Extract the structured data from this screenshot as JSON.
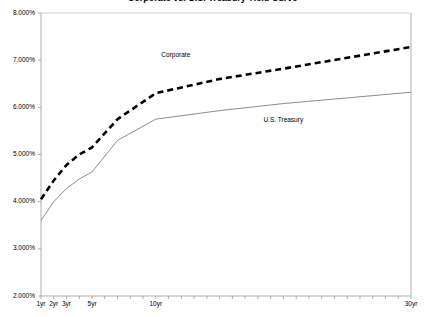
{
  "chart_data": {
    "type": "line",
    "title": "Corporate vs. U.S. Treasury Yield Curve",
    "xlabel": "",
    "ylabel": "",
    "xlim": [
      1,
      30
    ],
    "ylim": [
      2.0,
      8.0
    ],
    "grid": false,
    "legend_position": "inline-annotation",
    "y_tick_labels": [
      "8.000%",
      "7.000%",
      "6.000%",
      "5.000%",
      "4.000%",
      "3.000%",
      "2.000%"
    ],
    "y_tick_values": [
      8.0,
      7.0,
      6.0,
      5.0,
      4.0,
      3.0,
      2.0
    ],
    "x_tick_labels": [
      "1yr",
      "2yr",
      "3yr",
      "5yr",
      "10yr",
      "30yr"
    ],
    "x_tick_values": [
      1,
      2,
      3,
      5,
      10,
      30
    ],
    "x_minor_ticks": [
      1,
      2,
      3,
      4,
      5,
      6,
      7,
      8,
      9,
      10,
      11,
      12,
      13,
      14,
      15,
      16,
      17,
      18,
      19,
      20,
      21,
      22,
      23,
      24,
      25,
      26,
      27,
      28,
      29,
      30
    ],
    "x": [
      1,
      2,
      3,
      4,
      5,
      7,
      10,
      15,
      20,
      25,
      30
    ],
    "series": [
      {
        "name": "Corporate",
        "style": "dashed",
        "color": "#000000",
        "label_x": 12,
        "label_y": 7.08,
        "values": [
          4.05,
          4.45,
          4.78,
          5.0,
          5.15,
          5.75,
          6.3,
          6.6,
          6.82,
          7.05,
          7.28
        ]
      },
      {
        "name": "U.S. Treasury",
        "style": "solid",
        "color": "#808080",
        "label_x": 20,
        "label_y": 5.72,
        "values": [
          3.6,
          4.0,
          4.28,
          4.48,
          4.63,
          5.3,
          5.75,
          5.93,
          6.08,
          6.2,
          6.32
        ]
      }
    ]
  }
}
